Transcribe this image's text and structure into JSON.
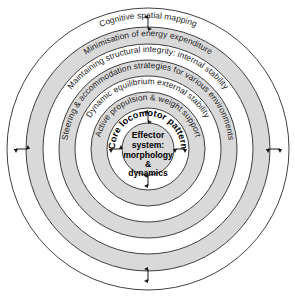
{
  "figure": {
    "center": {
      "x": 148,
      "y": 149
    },
    "background_color": "#ffffff",
    "band_fill_gray": "#d9d9d9",
    "band_fill_white": "#ffffff",
    "stroke_color": "#2b2b2b",
    "text_color": "#1a1a1a"
  },
  "center_node": {
    "name": "effector-system",
    "lines": [
      "Effector",
      "system:",
      "morphology",
      "&",
      "dynamics"
    ],
    "radius": 26,
    "fill": "#d9d9d9"
  },
  "rings": [
    {
      "index": 0,
      "name": "core-locomotor-pattern",
      "label": "Core locomotor pattern",
      "outer_radius": 41,
      "inner_radius": 26,
      "fill": "#ffffff",
      "bold": true,
      "text_radius": 33
    },
    {
      "index": 1,
      "name": "active-propulsion-weight-support",
      "label": "Active propulsion & weight support",
      "outer_radius": 57,
      "inner_radius": 41,
      "fill": "#d9d9d9",
      "bold": false,
      "text_radius": 49
    },
    {
      "index": 2,
      "name": "dynamic-equilibrium-external-stability",
      "label": "Dynamic equilibrium external stability",
      "outer_radius": 73,
      "inner_radius": 57,
      "fill": "#ffffff",
      "bold": false,
      "text_radius": 65
    },
    {
      "index": 3,
      "name": "steering-accommodation-strategies",
      "label": "Steering & accommodation strategies for various environments",
      "outer_radius": 89,
      "inner_radius": 73,
      "fill": "#d9d9d9",
      "bold": false,
      "text_radius": 81
    },
    {
      "index": 4,
      "name": "maintaining-structural-integrity",
      "label": "Maintaining structural integrity: internal stability",
      "outer_radius": 105,
      "inner_radius": 89,
      "fill": "#ffffff",
      "bold": false,
      "text_radius": 97
    },
    {
      "index": 5,
      "name": "minimisation-of-energy-expenditure",
      "label": "Minimisation of energy expenditure",
      "outer_radius": 122,
      "inner_radius": 105,
      "fill": "#d9d9d9",
      "bold": false,
      "text_radius": 113
    },
    {
      "index": 6,
      "name": "cognitive-spatial-mapping",
      "label": "Cognitive spatial mapping",
      "outer_radius": 141,
      "inner_radius": 122,
      "fill": "#ffffff",
      "bold": false,
      "text_radius": 131
    }
  ],
  "connector_arrows": [
    {
      "name": "arrow-center-up",
      "orientation": "vertical",
      "x": 148,
      "y": 117,
      "length": 10
    },
    {
      "name": "arrow-center-down",
      "orientation": "vertical",
      "x": 148,
      "y": 181,
      "length": 10
    },
    {
      "name": "arrow-center-left",
      "orientation": "horizontal",
      "x": 116,
      "y": 149,
      "length": 10
    },
    {
      "name": "arrow-center-right",
      "orientation": "horizontal",
      "x": 180,
      "y": 149,
      "length": 10
    },
    {
      "name": "arrow-outer-top",
      "orientation": "vertical",
      "x": 148,
      "y": 23,
      "length": 11
    },
    {
      "name": "arrow-outer-bottom",
      "orientation": "vertical",
      "x": 148,
      "y": 275,
      "length": 11
    },
    {
      "name": "arrow-outer-left",
      "orientation": "horizontal",
      "x": 22,
      "y": 149,
      "length": 11
    },
    {
      "name": "arrow-outer-right",
      "orientation": "horizontal",
      "x": 274,
      "y": 149,
      "length": 11
    }
  ]
}
